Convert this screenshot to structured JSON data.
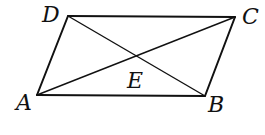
{
  "diagram": {
    "type": "parallelogram-with-diagonals",
    "points": {
      "A": {
        "x": 37,
        "y": 95
      },
      "B": {
        "x": 205,
        "y": 96
      },
      "C": {
        "x": 235,
        "y": 17
      },
      "D": {
        "x": 68,
        "y": 16
      },
      "E": {
        "x": 136,
        "y": 56
      }
    },
    "labels": {
      "A": "A",
      "B": "B",
      "C": "C",
      "D": "D",
      "E": "E"
    },
    "edges": [
      [
        "A",
        "B"
      ],
      [
        "B",
        "C"
      ],
      [
        "C",
        "D"
      ],
      [
        "D",
        "A"
      ]
    ],
    "diagonals": [
      [
        "A",
        "C"
      ],
      [
        "D",
        "B"
      ]
    ],
    "intersection": "E",
    "stroke_color": "#111111"
  }
}
